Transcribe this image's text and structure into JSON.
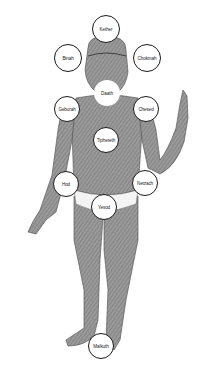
{
  "diagram": {
    "colors": {
      "border": "#1a1a1a",
      "fill": "#ffffff",
      "figure": "#8a8a8a",
      "figure_dark": "#5a5a5a"
    },
    "nodes": [
      {
        "label": "Kether",
        "cx": 106,
        "cy": 29,
        "r": 14,
        "border": true
      },
      {
        "label": "Binah",
        "cx": 68,
        "cy": 58,
        "r": 14,
        "border": true
      },
      {
        "label": "Chokmah",
        "cx": 147,
        "cy": 58,
        "r": 14,
        "border": true
      },
      {
        "label": "Daath",
        "cx": 107,
        "cy": 93,
        "r": 13,
        "border": false
      },
      {
        "label": "Geburah",
        "cx": 67,
        "cy": 109,
        "r": 13,
        "border": true
      },
      {
        "label": "Chesed",
        "cx": 146,
        "cy": 109,
        "r": 13,
        "border": true
      },
      {
        "label": "Tiphereth",
        "cx": 106,
        "cy": 140,
        "r": 13,
        "border": true
      },
      {
        "label": "Hod",
        "cx": 66,
        "cy": 184,
        "r": 13,
        "border": true
      },
      {
        "label": "Netzach",
        "cx": 145,
        "cy": 183,
        "r": 13,
        "border": true
      },
      {
        "label": "Yesod",
        "cx": 104,
        "cy": 207,
        "r": 13,
        "border": true
      },
      {
        "label": "Malkuth",
        "cx": 101,
        "cy": 346,
        "r": 13,
        "border": true
      }
    ]
  }
}
